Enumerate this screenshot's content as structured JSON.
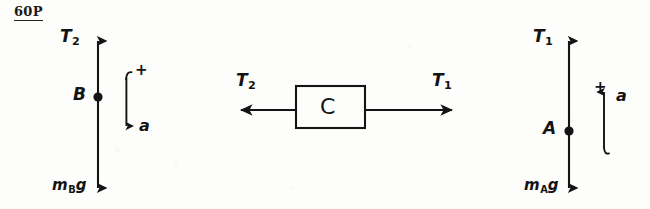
{
  "page": {
    "background_color": "#fdfdfc",
    "ink_color": "#141414",
    "width": 650,
    "height": 209
  },
  "problem_stamp": {
    "text": "60P",
    "underlined": true
  },
  "diagrams": [
    {
      "id": "left-free-body-diagram",
      "name": "free-body-diagram-B",
      "point_label": "B",
      "up_force_label": "T",
      "up_force_subscript": "2",
      "down_force_label": "m",
      "down_force_subscript": "B",
      "down_force_suffix": "g",
      "acceleration_label": "a",
      "positive_sign": "+",
      "acceleration_direction": "down"
    },
    {
      "id": "middle-block-diagram",
      "name": "block-C-diagram",
      "block_label": "C",
      "left_force_label": "T",
      "left_force_subscript": "2",
      "right_force_label": "T",
      "right_force_subscript": "1",
      "left_arrow_direction": "left",
      "right_arrow_direction": "right"
    },
    {
      "id": "right-free-body-diagram",
      "name": "free-body-diagram-A",
      "point_label": "A",
      "up_force_label": "T",
      "up_force_subscript": "1",
      "down_force_label": "m",
      "down_force_subscript": "A",
      "down_force_suffix": "g",
      "acceleration_label": "a",
      "positive_sign": "+",
      "acceleration_direction": "up"
    }
  ]
}
